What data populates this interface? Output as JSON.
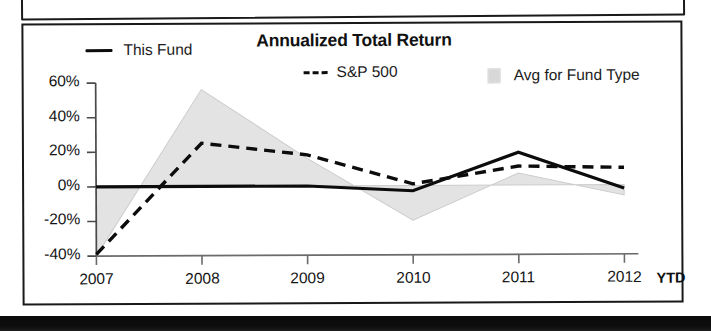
{
  "chart_data": {
    "type": "line",
    "title": "Annualized Total Return",
    "xlabel": "",
    "ylabel": "",
    "x": [
      "2007",
      "2008",
      "2009",
      "2010",
      "2011",
      "2012"
    ],
    "categories": [
      "2007",
      "2008",
      "2009",
      "2010",
      "2011",
      "2012"
    ],
    "ytick_labels": [
      "60%",
      "40%",
      "20%",
      "0%",
      "-20%",
      "-40%"
    ],
    "ytick_values": [
      60,
      40,
      20,
      0,
      -20,
      -40
    ],
    "ylim": [
      -40,
      60
    ],
    "grid": false,
    "legend_position": "top",
    "x_axis_note": "YTD",
    "series": [
      {
        "name": "This Fund",
        "style": "solid",
        "color": "#0c0c0c",
        "values": [
          0,
          0,
          0,
          -3,
          19,
          -2
        ]
      },
      {
        "name": "S&P 500",
        "style": "dashed",
        "color": "#0c0c0c",
        "values": [
          -39,
          25,
          18,
          1,
          11,
          10
        ]
      },
      {
        "name": "Avg for Fund Type",
        "style": "area",
        "color": "#d8d8d8",
        "values": [
          -40,
          56,
          16,
          -20,
          7,
          -6
        ]
      }
    ]
  },
  "legend": {
    "items": [
      {
        "label": "This Fund",
        "marker": "solid-line-swatch"
      },
      {
        "label": "S&P 500",
        "marker": "dashed-line-swatch"
      },
      {
        "label": "Avg for Fund Type",
        "marker": "area-swatch"
      }
    ]
  },
  "colors": {
    "line": "#0c0c0c",
    "area_fill": "#e3e3e3",
    "area_stroke": "#c9c9c9",
    "frame": "#17191a",
    "text": "#151515"
  }
}
